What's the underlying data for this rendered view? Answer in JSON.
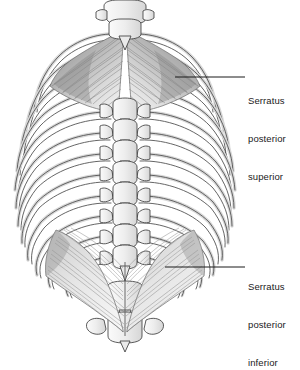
{
  "figure": {
    "view": "posterior view of thorax",
    "background_color": "#ffffff",
    "ink_color": "#1a1a1a",
    "bone_fill": "#f4f4f4",
    "bone_outline": "#4a4a4a",
    "muscle_tone": "#9a9a9a",
    "muscle_shadow": "#6e6e6e"
  },
  "labels": {
    "superior": {
      "line1": "Serratus",
      "line2": "posterior",
      "line3": "superior",
      "text": "Serratus posterior superior",
      "leader": {
        "x1": 175,
        "y1": 77,
        "x2": 245,
        "y2": 77
      }
    },
    "inferior": {
      "line1": "Serratus",
      "line2": "posterior",
      "line3": "inferior",
      "text": "Serratus posterior inferior",
      "leader": {
        "x1": 165,
        "y1": 267,
        "x2": 245,
        "y2": 267
      }
    }
  },
  "anatomy": {
    "rib_pairs": 12,
    "vertebrae_visible": "cervical C7 through lumbar L2",
    "structures": [
      "vertebral column",
      "spinous processes",
      "transverse processes",
      "ribs",
      "serratus posterior superior muscle",
      "serratus posterior inferior muscle"
    ]
  }
}
